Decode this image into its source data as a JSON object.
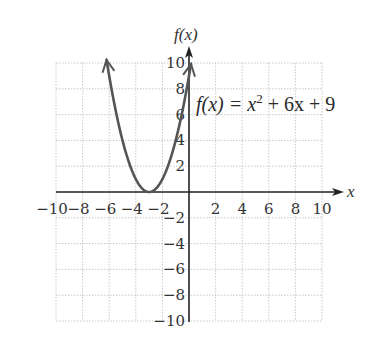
{
  "chart_data": {
    "type": "line",
    "title": "",
    "function_label": "f(x) = x² + 6x + 9",
    "function_label_parts": {
      "lhs": "f(x) = x",
      "exp": "2",
      "rhs": " + 6x + 9"
    },
    "xlabel": "x",
    "ylabel": "f(x)",
    "xlim": [
      -10,
      10
    ],
    "ylim": [
      -10,
      10
    ],
    "grid": true,
    "grid_step": 2,
    "x_ticks": [
      -10,
      -8,
      -6,
      -4,
      -2,
      2,
      4,
      6,
      8,
      10
    ],
    "y_ticks": [
      -10,
      -8,
      -6,
      -4,
      -2,
      2,
      4,
      6,
      8,
      10
    ],
    "series": [
      {
        "name": "f(x) = x^2 + 6x + 9",
        "color": "#555555",
        "x": [
          -6.2,
          -6,
          -5,
          -4,
          -3,
          -2,
          -1,
          0,
          0.15
        ],
        "y": [
          10.24,
          9,
          4,
          1,
          0,
          1,
          4,
          9,
          9.92
        ],
        "vertex": [
          -3,
          0
        ],
        "arrows_at_ends": true
      }
    ]
  },
  "labels": {
    "x_tick_text": [
      "−10",
      "−8",
      "−6",
      "−4",
      "−2",
      "2",
      "4",
      "6",
      "8",
      "10"
    ],
    "y_tick_text": [
      "10",
      "8",
      "6",
      "4",
      "2",
      "−2",
      "−4",
      "−6",
      "−8",
      "−10"
    ]
  }
}
